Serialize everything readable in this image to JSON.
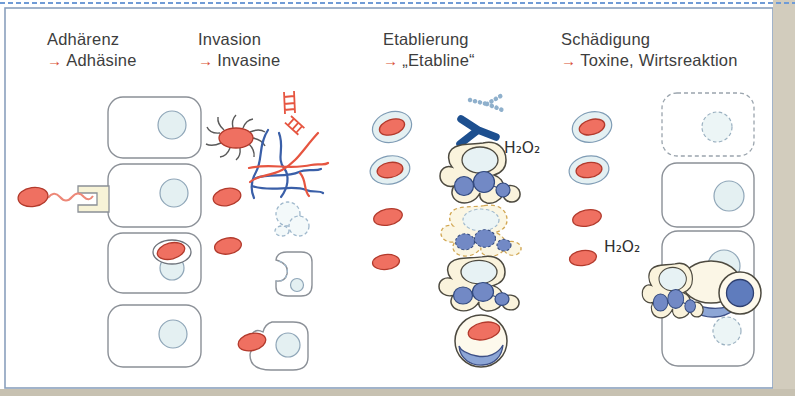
{
  "figure": {
    "arrow_glyph": "→",
    "columns": [
      {
        "id": "adherence",
        "title": "Adhärenz",
        "subtitle": "Adhäsine"
      },
      {
        "id": "invasion",
        "title": "Invasion",
        "subtitle": "Invasine"
      },
      {
        "id": "establishment",
        "title": "Etablierung",
        "subtitle": "„Etabline“"
      },
      {
        "id": "damage",
        "title": "Schädigung",
        "subtitle": "Toxine, Wirtsreaktion"
      }
    ],
    "labels": {
      "h2o2_establishment": "H₂O₂",
      "h2o2_damage": "H₂O₂"
    },
    "colors": {
      "bacterium_fill": "#ef7061",
      "bacterium_stroke": "#b23a2c",
      "cell_stroke": "#8b9097",
      "nucleus_fill": "#e4f0f2",
      "capsule_fill": "#e4f0f2",
      "phagocyte_fill": "#faf3dc",
      "nucleus_lobe_fill": "#7289c5",
      "antibody_color": "#1d4f8f",
      "cytoskeleton_blue": "#3a5fa8",
      "cytoskeleton_red": "#e65540",
      "arrow_color": "#d94f33",
      "frame_color": "#8aa0bd",
      "top_dashed_border": "#6f9bd6"
    },
    "icons": [
      "bacterium-icon",
      "flagellated-bacterium-icon",
      "host-cell",
      "receptor-icon",
      "tight-junction-icon",
      "cytoskeleton-icon",
      "lysed-cell-icon",
      "phagocyte-icon",
      "destroyed-phagocyte-icon",
      "antibody-icon",
      "degraded-antibody-icon",
      "capsulated-bacterium-icon",
      "macrophage-icon",
      "arrow-icon"
    ]
  }
}
